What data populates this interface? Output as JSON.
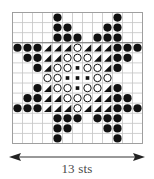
{
  "chart": {
    "columns": 13,
    "rows": 13,
    "legend_symbols": {
      "dot": "filled-circle",
      "tri": "half-filled-triangle",
      "ring": "open-circle",
      "sq": "small-filled-square",
      "_": "empty"
    },
    "grid": [
      [
        "_",
        "_",
        "_",
        "_",
        "dot",
        "_",
        "_",
        "_",
        "_",
        "_",
        "dot",
        "_",
        "_"
      ],
      [
        "_",
        "_",
        "_",
        "_",
        "dot",
        "dot",
        "_",
        "_",
        "_",
        "dot",
        "dot",
        "_",
        "_"
      ],
      [
        "_",
        "_",
        "_",
        "_",
        "dot",
        "dot",
        "dot",
        "_",
        "dot",
        "dot",
        "dot",
        "_",
        "_"
      ],
      [
        "dot",
        "dot",
        "dot",
        "tri",
        "tri",
        "tri",
        "ring",
        "tri",
        "tri",
        "tri",
        "dot",
        "dot",
        "dot"
      ],
      [
        "_",
        "dot",
        "dot",
        "tri",
        "tri",
        "ring",
        "ring",
        "ring",
        "tri",
        "tri",
        "dot",
        "dot",
        "_"
      ],
      [
        "_",
        "_",
        "dot",
        "tri",
        "ring",
        "ring",
        "sq",
        "ring",
        "ring",
        "tri",
        "dot",
        "_",
        "_"
      ],
      [
        "_",
        "_",
        "_",
        "ring",
        "ring",
        "sq",
        "sq",
        "sq",
        "ring",
        "ring",
        "_",
        "_",
        "_"
      ],
      [
        "_",
        "_",
        "dot",
        "tri",
        "ring",
        "ring",
        "sq",
        "ring",
        "ring",
        "tri",
        "dot",
        "_",
        "_"
      ],
      [
        "_",
        "dot",
        "dot",
        "tri",
        "tri",
        "ring",
        "ring",
        "ring",
        "tri",
        "tri",
        "dot",
        "dot",
        "_"
      ],
      [
        "dot",
        "dot",
        "dot",
        "tri",
        "tri",
        "tri",
        "ring",
        "tri",
        "tri",
        "tri",
        "dot",
        "dot",
        "dot"
      ],
      [
        "_",
        "_",
        "_",
        "_",
        "dot",
        "dot",
        "dot",
        "_",
        "dot",
        "dot",
        "dot",
        "_",
        "_"
      ],
      [
        "_",
        "_",
        "_",
        "_",
        "dot",
        "dot",
        "_",
        "_",
        "_",
        "dot",
        "dot",
        "_",
        "_"
      ],
      [
        "_",
        "_",
        "_",
        "_",
        "dot",
        "_",
        "_",
        "_",
        "_",
        "_",
        "dot",
        "_",
        "_"
      ]
    ],
    "colors": {
      "grid_line": "#c4c4c4",
      "border": "#9a9a9a",
      "symbol": "#111111"
    }
  },
  "width_indicator": {
    "label": "13 sts"
  }
}
